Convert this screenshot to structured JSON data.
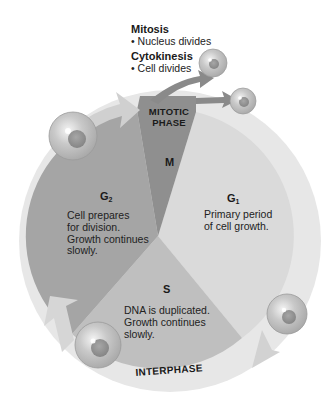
{
  "diagram": {
    "mitotic_phase": {
      "label": "MITOTIC\nPHASE",
      "label_line1": "MITOTIC",
      "label_line2": "PHASE",
      "symbol": "M"
    },
    "mitosis": {
      "heading": "Mitosis",
      "bullet": "• Nucleus divides"
    },
    "cytokinesis": {
      "heading": "Cytokinesis",
      "bullet": "• Cell divides"
    },
    "phases": [
      {
        "id": "G1",
        "symbol": "G",
        "subscript": "1",
        "description": "Primary period of cell growth.",
        "lines": [
          "Primary period",
          "of cell growth."
        ]
      },
      {
        "id": "S",
        "symbol": "S",
        "subscript": "",
        "description": "DNA is duplicated. Growth continues slowly.",
        "lines": [
          "DNA is duplicated.",
          "Growth continues",
          "slowly."
        ]
      },
      {
        "id": "G2",
        "symbol": "G",
        "subscript": "2",
        "description": "Cell prepares for division. Growth continues slowly.",
        "lines": [
          "Cell prepares",
          "for division.",
          "Growth continues",
          "slowly."
        ]
      }
    ],
    "interphase_label": "INTERPHASE",
    "colors": {
      "ring": "#e6e6e6",
      "g1": "#d9d9d9",
      "s": "#bdbdbd",
      "g2": "#a3a3a3",
      "m": "#8e8e8e",
      "cell_fill": "#bcbcbc",
      "cell_nucleus": "#8f8f8f"
    }
  }
}
